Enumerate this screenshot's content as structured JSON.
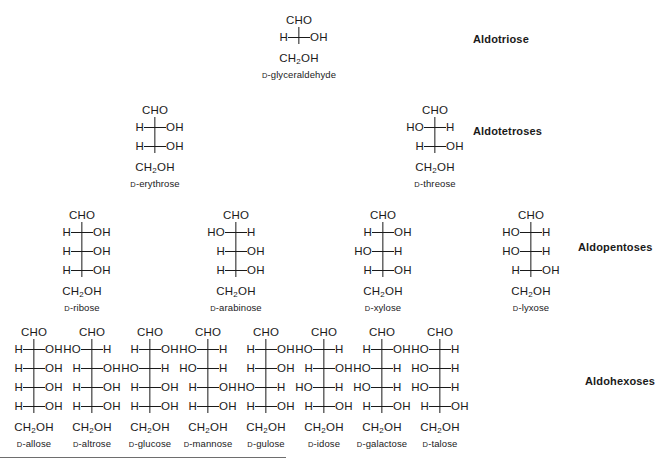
{
  "diagram": {
    "background_color": "#ffffff",
    "text_color": "#1a1a1a",
    "bond_color": "#1a1a1a",
    "rule_color": "#6e6e6e",
    "d_prefix": "D",
    "top_group": "CHO",
    "bottom_group_text": "CH",
    "bottom_group_sub": "2",
    "bottom_group_tail": "OH",
    "group_h": "H",
    "group_oh_right": "OH",
    "group_ho_left": "HO",
    "group_h_right": "H"
  },
  "family_labels": [
    {
      "text": "Aldotriose",
      "x": 473,
      "y": 33
    },
    {
      "text": "Aldotetroses",
      "x": 473,
      "y": 125
    },
    {
      "text": "Aldopentoses",
      "x": 578,
      "y": 241
    },
    {
      "text": "Aldohexoses",
      "x": 585,
      "y": 375
    }
  ],
  "rows": [
    {
      "name": "aldotriose",
      "stereocenters": 1,
      "top": 10,
      "molecules": [
        {
          "name": "glyceraldehyde",
          "x": 299,
          "config": [
            "R"
          ]
        }
      ]
    },
    {
      "name": "aldotetroses",
      "stereocenters": 2,
      "top": 100,
      "molecules": [
        {
          "name": "erythrose",
          "x": 155,
          "config": [
            "R",
            "R"
          ]
        },
        {
          "name": "threose",
          "x": 435,
          "config": [
            "L",
            "R"
          ]
        }
      ]
    },
    {
      "name": "aldopentoses",
      "stereocenters": 3,
      "top": 205,
      "molecules": [
        {
          "name": "ribose",
          "x": 82,
          "config": [
            "R",
            "R",
            "R"
          ]
        },
        {
          "name": "arabinose",
          "x": 236,
          "config": [
            "L",
            "R",
            "R"
          ]
        },
        {
          "name": "xylose",
          "x": 383,
          "config": [
            "R",
            "L",
            "R"
          ]
        },
        {
          "name": "lyxose",
          "x": 531,
          "config": [
            "L",
            "L",
            "R"
          ]
        }
      ]
    },
    {
      "name": "aldohexoses",
      "stereocenters": 4,
      "top": 322,
      "molecules": [
        {
          "name": "allose",
          "x": 34,
          "config": [
            "R",
            "R",
            "R",
            "R"
          ]
        },
        {
          "name": "altrose",
          "x": 92,
          "config": [
            "L",
            "R",
            "R",
            "R"
          ]
        },
        {
          "name": "glucose",
          "x": 150,
          "config": [
            "R",
            "L",
            "R",
            "R"
          ]
        },
        {
          "name": "mannose",
          "x": 208,
          "config": [
            "L",
            "L",
            "R",
            "R"
          ]
        },
        {
          "name": "gulose",
          "x": 266,
          "config": [
            "R",
            "R",
            "L",
            "R"
          ]
        },
        {
          "name": "idose",
          "x": 324,
          "config": [
            "L",
            "R",
            "L",
            "R"
          ]
        },
        {
          "name": "galactose",
          "x": 382,
          "config": [
            "R",
            "L",
            "L",
            "R"
          ]
        },
        {
          "name": "talose",
          "x": 440,
          "config": [
            "L",
            "L",
            "L",
            "R"
          ]
        }
      ]
    }
  ]
}
